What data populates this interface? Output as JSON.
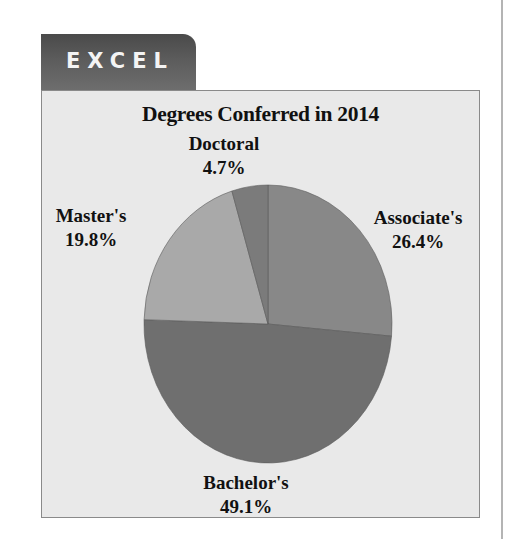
{
  "tab": {
    "label": "EXCEL"
  },
  "chart": {
    "title": "Degrees Conferred in 2014"
  },
  "colors": {
    "associates": "#888888",
    "bachelors": "#6f6f6f",
    "masters": "#a9a9a9",
    "doctoral": "#7b7b7b",
    "background": "#e9e9e9"
  },
  "labels": {
    "associates": {
      "name": "Associate's",
      "pct": "26.4%"
    },
    "bachelors": {
      "name": "Bachelor's",
      "pct": "49.1%"
    },
    "masters": {
      "name": "Master's",
      "pct": "19.8%"
    },
    "doctoral": {
      "name": "Doctoral",
      "pct": "4.7%"
    }
  },
  "chart_data": {
    "type": "pie",
    "title": "Degrees Conferred in 2014",
    "categories": [
      "Associate's",
      "Bachelor's",
      "Master's",
      "Doctoral"
    ],
    "values": [
      26.4,
      49.1,
      19.8,
      4.7
    ],
    "unit": "%",
    "start_angle": "12 o'clock",
    "direction": "clockwise",
    "legend": "none (data labels outside slices)"
  }
}
